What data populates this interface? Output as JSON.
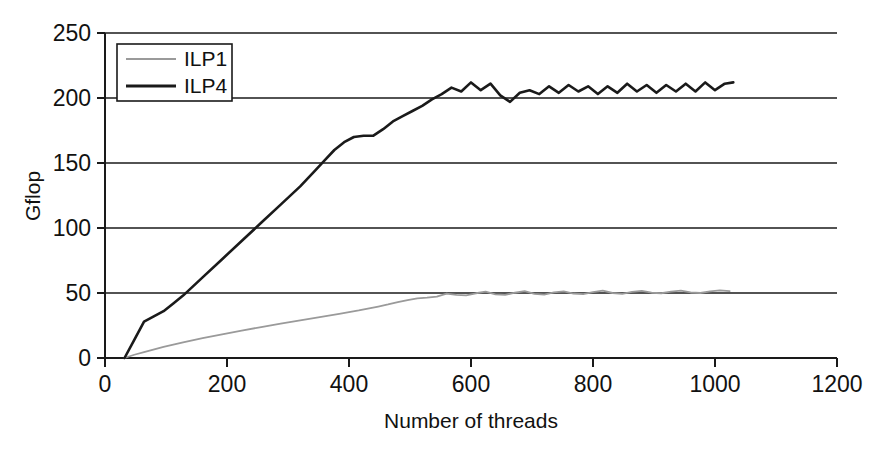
{
  "chart_data": {
    "type": "line",
    "title": "",
    "xlabel": "Number of threads",
    "ylabel": "Gflop",
    "xlim": [
      0,
      1200
    ],
    "ylim": [
      0,
      250
    ],
    "xticks": [
      0,
      200,
      400,
      600,
      800,
      1000,
      1200
    ],
    "yticks": [
      0,
      50,
      100,
      150,
      200,
      250
    ],
    "grid": "horizontal",
    "legend_position": "top-left-inside",
    "series": [
      {
        "name": "ILP1",
        "color": "#9a9a9a",
        "x": [
          32,
          48,
          64,
          96,
          128,
          160,
          192,
          224,
          256,
          288,
          320,
          352,
          384,
          416,
          448,
          464,
          480,
          496,
          512,
          528,
          544,
          560,
          576,
          592,
          608,
          624,
          640,
          656,
          672,
          688,
          704,
          720,
          736,
          752,
          768,
          784,
          800,
          816,
          832,
          848,
          864,
          880,
          896,
          912,
          928,
          944,
          960,
          976,
          992,
          1008,
          1024
        ],
        "y": [
          0,
          2.5,
          4.5,
          8.5,
          12.0,
          15.2,
          18.2,
          21.0,
          23.8,
          26.4,
          29.0,
          31.4,
          34.0,
          36.6,
          39.6,
          41.2,
          43.0,
          44.6,
          45.8,
          46.4,
          47.2,
          49.6,
          48.6,
          48.2,
          49.8,
          51.0,
          49.0,
          48.6,
          50.2,
          51.4,
          49.4,
          48.8,
          50.4,
          51.2,
          49.6,
          49.2,
          50.6,
          51.8,
          50.0,
          49.4,
          50.8,
          51.6,
          50.2,
          49.8,
          51.0,
          51.8,
          50.4,
          50.0,
          51.2,
          52.0,
          51.4
        ]
      },
      {
        "name": "ILP4",
        "color": "#1a1a1a",
        "x": [
          32,
          48,
          64,
          80,
          96,
          112,
          128,
          160,
          192,
          224,
          256,
          288,
          320,
          344,
          360,
          376,
          392,
          408,
          424,
          440,
          456,
          472,
          488,
          504,
          520,
          536,
          552,
          568,
          584,
          600,
          616,
          632,
          648,
          664,
          680,
          696,
          712,
          728,
          744,
          760,
          776,
          792,
          808,
          824,
          840,
          856,
          872,
          888,
          904,
          920,
          936,
          952,
          968,
          984,
          1000,
          1016,
          1030
        ],
        "y": [
          0,
          14,
          28,
          32,
          36,
          42,
          48,
          62,
          76,
          90,
          104,
          118,
          132,
          144,
          152,
          160,
          166,
          170,
          171,
          171,
          176,
          182,
          186,
          190,
          194,
          199,
          203,
          208,
          205,
          212,
          206,
          211,
          202,
          197,
          204,
          206,
          203,
          209,
          204,
          210,
          205,
          209,
          203,
          209,
          204,
          211,
          205,
          210,
          204,
          210,
          205,
          211,
          205,
          212,
          206,
          211,
          212
        ]
      }
    ]
  },
  "legend": {
    "items": [
      {
        "label": "ILP1",
        "color": "#9a9a9a"
      },
      {
        "label": "ILP4",
        "color": "#1a1a1a"
      }
    ]
  },
  "axes": {
    "y_title": "Gflop",
    "x_title": "Number of threads",
    "y_tick_labels": [
      "0",
      "50",
      "100",
      "150",
      "200",
      "250"
    ],
    "x_tick_labels": [
      "0",
      "200",
      "400",
      "600",
      "800",
      "1000",
      "1200"
    ]
  }
}
